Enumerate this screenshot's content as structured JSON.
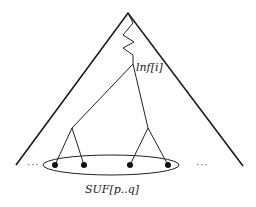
{
  "diagram": {
    "title": "",
    "node_label": "lnf[i]",
    "set_label": "SUF[p..q]",
    "left_ellipsis": "···",
    "right_ellipsis": "···",
    "colors": {
      "stroke": "#222222",
      "leaf": "#111111",
      "background": "#ffffff"
    },
    "structure": {
      "root": "apex",
      "path_to_node": "zigzag",
      "node": "lnf[i]",
      "subtrees": [
        {
          "name": "left-subtree",
          "leaves": 2
        },
        {
          "name": "right-subtree",
          "leaves": 2
        }
      ],
      "leaves_in_set": 4
    }
  }
}
